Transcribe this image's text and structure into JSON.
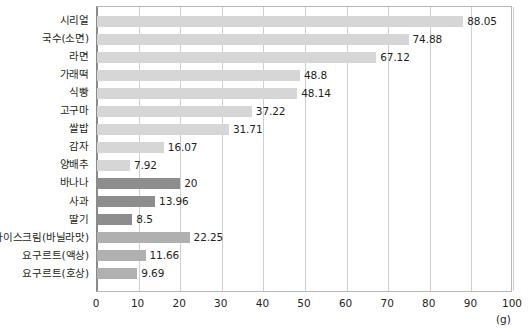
{
  "chart_data": {
    "type": "bar",
    "orientation": "horizontal",
    "title": "",
    "xlabel": "(g)",
    "ylabel": "",
    "xlim": [
      0,
      100
    ],
    "xticks": [
      0,
      10,
      20,
      30,
      40,
      50,
      60,
      70,
      80,
      90,
      100
    ],
    "grid": true,
    "legend": "none",
    "unit": "(g)",
    "categories": [
      "시리얼",
      "국수(소면)",
      "라면",
      "가래떡",
      "식빵",
      "고구마",
      "쌀밥",
      "감자",
      "양배추",
      "바나나",
      "사과",
      "딸기",
      "아이스크림(바닐라맛)",
      "요구르트(액상)",
      "요구르트(호상)"
    ],
    "values": [
      88.05,
      74.88,
      67.12,
      48.8,
      48.14,
      37.22,
      31.71,
      16.07,
      7.92,
      20,
      13.96,
      8.5,
      22.25,
      11.66,
      9.69
    ],
    "value_labels": [
      "88.05",
      "74.88",
      "67.12",
      "48.8",
      "48.14",
      "37.22",
      "31.71",
      "16.07",
      "7.92",
      "20",
      "13.96",
      "8.5",
      "22.25",
      "11.66",
      "9.69"
    ],
    "bar_tiers": [
      "light",
      "light",
      "light",
      "light",
      "light",
      "light",
      "light",
      "light",
      "light",
      "dark",
      "dark",
      "dark",
      "medium",
      "medium",
      "medium"
    ]
  },
  "colors": {
    "bar_light": "#d6d6d6",
    "bar_medium": "#b0b0b0",
    "bar_dark": "#8d8d8d",
    "gridline": "#cfcfcf",
    "axis": "#8a8a8a",
    "frame": "#b9b9b9",
    "text": "#231f20",
    "background": "#ffffff"
  }
}
